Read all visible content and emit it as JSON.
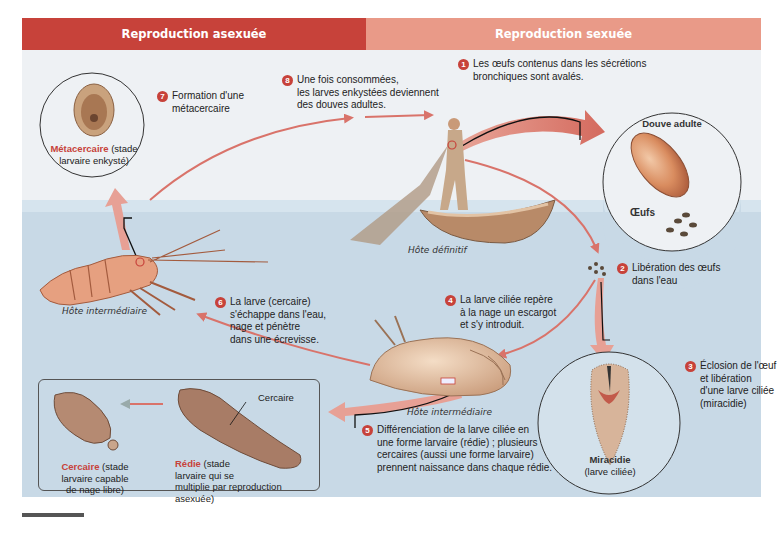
{
  "headers": {
    "left": "Reproduction asexuée",
    "right": "Reproduction sexuée"
  },
  "colors": {
    "header_left": "#c7423a",
    "header_right": "#e99a88",
    "sky": "#eef1f4",
    "water": "#c8d9e6",
    "arrow": "#d9736a",
    "step_badge": "#c7423a"
  },
  "steps": [
    {
      "number": "1",
      "text_lines": [
        "Les œufs contenus dans les sécrétions",
        "bronchiques sont avalés."
      ]
    },
    {
      "number": "2",
      "text_lines": [
        "Libération des œufs",
        "dans l'eau"
      ]
    },
    {
      "number": "3",
      "text_lines": [
        "Éclosion de l'œuf",
        "et libération",
        "d'une larve ciliée",
        "(miracidie)"
      ]
    },
    {
      "number": "4",
      "text_lines": [
        "La larve ciliée repère",
        "à la nage un escargot",
        "et s'y introduit."
      ]
    },
    {
      "number": "5",
      "text_lines": [
        "Différenciation de la larve ciliée en",
        "une forme larvaire (rédie) ; plusieurs",
        "cercaires (aussi une forme larvaire)",
        "prennent naissance dans chaque rédie."
      ]
    },
    {
      "number": "6",
      "text_lines": [
        "La larve (cercaire)",
        "s'échappe dans l'eau,",
        "nage et pénètre",
        "dans une écrevisse."
      ]
    },
    {
      "number": "7",
      "text_lines": [
        "Formation d'une",
        "métacercaire"
      ]
    },
    {
      "number": "8",
      "text_lines": [
        "Une fois consommées,",
        "les larves enkystées deviennent",
        "des douves adultes."
      ]
    }
  ],
  "hosts": {
    "definitive": "Hôte définitif",
    "intermediate_crayfish": "Hôte intermédiaire",
    "intermediate_snail": "Hôte intermédiaire"
  },
  "circles": {
    "adult_fluke": {
      "title": "Douve adulte",
      "eggs_label": "Œufs"
    },
    "metacercaria": {
      "title": "Métacercaire",
      "subtitle_a": " (stade",
      "subtitle_b": "larvaire enkysté)"
    },
    "miracidium": {
      "title": "Miracidie",
      "subtitle": "(larve ciliée)"
    }
  },
  "box": {
    "cercaria_title": "Cercaire",
    "cercaria_lines": [
      " (stade",
      "larvaire capable",
      "de nage libre)"
    ],
    "redia_title": "Rédie",
    "redia_lines": [
      " (stade",
      "larvaire qui se",
      "multiplie par reproduction",
      "asexuée)"
    ],
    "cercaria_pointer": "Cercaire"
  }
}
